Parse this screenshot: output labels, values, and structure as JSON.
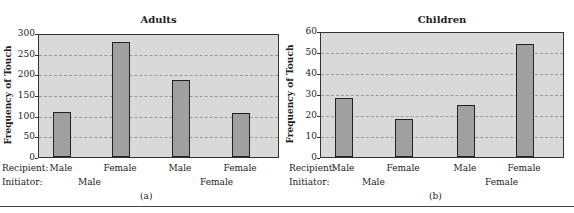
{
  "chart_data": [
    {
      "type": "bar",
      "title": "Adults",
      "subtitle": "(a)",
      "ylabel": "Frequency of Touch",
      "xlabel": "",
      "ylim": [
        0,
        300
      ],
      "yticks": [
        0,
        50,
        100,
        150,
        200,
        250,
        300
      ],
      "grid": true,
      "categories": [
        "Male→Male",
        "Male→Female",
        "Female→Male",
        "Female→Female"
      ],
      "recipient_labels": [
        "Male",
        "Female",
        "Male",
        "Female"
      ],
      "initiator_labels": [
        "Male",
        "Female"
      ],
      "values": [
        108,
        278,
        187,
        106
      ]
    },
    {
      "type": "bar",
      "title": "Children",
      "subtitle": "(b)",
      "ylabel": "Frequency of Touch",
      "xlabel": "",
      "ylim": [
        0,
        60
      ],
      "yticks": [
        0,
        10,
        20,
        30,
        40,
        50,
        60
      ],
      "grid": true,
      "categories": [
        "Male→Male",
        "Male→Female",
        "Female→Male",
        "Female→Female"
      ],
      "recipient_labels": [
        "Male",
        "Female",
        "Male",
        "Female"
      ],
      "initiator_labels": [
        "Male",
        "Female"
      ],
      "values": [
        28,
        18,
        25,
        54
      ]
    }
  ],
  "labels": {
    "recipient": "Recipient:",
    "initiator": "Initiator:"
  }
}
